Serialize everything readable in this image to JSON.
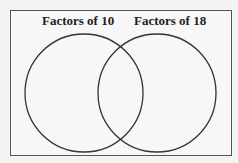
{
  "diagram": {
    "type": "venn",
    "sets": [
      {
        "label": "Factors of 10",
        "cx": 84,
        "cy": 93,
        "r": 59
      },
      {
        "label": "Factors of 18",
        "cx": 157,
        "cy": 93,
        "r": 59
      }
    ],
    "colors": {
      "stroke": "#333333",
      "border": "#555555",
      "background": "#f7f7f7"
    }
  }
}
